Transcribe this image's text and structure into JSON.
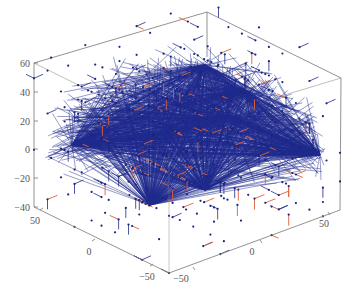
{
  "chart_data": {
    "type": "scatter",
    "subtype": "3d-network-graph",
    "title": "",
    "xlabel": "",
    "ylabel": "",
    "zlabel": "",
    "grid": false,
    "legend": null,
    "axes": {
      "x": {
        "range": [
          -60,
          60
        ],
        "ticks": [
          -50,
          0,
          50
        ],
        "tick_labels": [
          "−50",
          "0",
          "50"
        ]
      },
      "y": {
        "range": [
          -60,
          60
        ],
        "ticks": [
          -50,
          0,
          50
        ],
        "tick_labels": [
          "−50",
          "0",
          "50"
        ]
      },
      "z": {
        "range": [
          -40,
          60
        ],
        "ticks": [
          -40,
          -20,
          0,
          20,
          40,
          60
        ],
        "tick_labels": [
          "−40",
          "−20",
          "0",
          "20",
          "40",
          "60"
        ]
      }
    },
    "series": [
      {
        "name": "nodes",
        "kind": "points",
        "color": "#1a237e",
        "marker_size": 1.6,
        "description": "Regular 3D lattice of nodes spanning the box"
      },
      {
        "name": "long-range-edges",
        "kind": "lines",
        "color": "#1f2a8c",
        "description": "Dense blue edges converging on hub nodes forming a dome"
      },
      {
        "name": "short-edges",
        "kind": "lines",
        "color": "#e0603a",
        "description": "Short red/orange nearest-neighbour edges"
      }
    ],
    "hubs": [
      {
        "label": "left-hub",
        "screen": [
          72,
          145
        ]
      },
      {
        "label": "top-hub",
        "screen": [
          205,
          65
        ]
      },
      {
        "label": "upper-right-hub",
        "screen": [
          245,
          90
        ]
      },
      {
        "label": "center-hub",
        "screen": [
          228,
          118
        ]
      },
      {
        "label": "right-hub",
        "screen": [
          320,
          155
        ]
      },
      {
        "label": "lower-hub",
        "screen": [
          205,
          190
        ]
      },
      {
        "label": "bottom-left-hub",
        "screen": [
          150,
          205
        ]
      }
    ]
  },
  "layout": {
    "box": {
      "top_left": [
        34,
        63
      ],
      "top_back": [
        207,
        12
      ],
      "top_right": [
        341,
        78
      ],
      "top_front": [
        169,
        130
      ],
      "bottom_left": [
        34,
        207
      ],
      "bottom_back": [
        207,
        150
      ],
      "bottom_right": [
        340,
        210
      ],
      "bottom_front": [
        169,
        273
      ]
    },
    "z_ticks_screen_y": [
      207,
      178,
      149,
      121,
      92,
      63
    ],
    "y_axis_tick_screen": [
      [
        40,
        210
      ],
      [
        92,
        241
      ],
      [
        150,
        266
      ]
    ],
    "x_axis_tick_screen": [
      [
        195,
        270
      ],
      [
        262,
        243
      ],
      [
        330,
        215
      ]
    ],
    "seed": 7,
    "lattice_n": 11,
    "edge_count_blue": 1400,
    "edge_count_red": 90,
    "colors": {
      "background": "#ffffff",
      "box": "#777777",
      "node": "#1a237e",
      "edge_blue": "#1f2a8c",
      "edge_red": "#e0603a",
      "tick_text": "#555555"
    }
  }
}
